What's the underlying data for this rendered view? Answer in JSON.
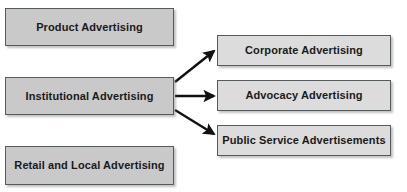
{
  "diagram": {
    "canvas": {
      "width": 407,
      "height": 192,
      "background": "#ffffff"
    },
    "colors": {
      "left_node_fill": "#c9c9c9",
      "right_node_fill": "#dcdcdc",
      "node_border": "#555a5c",
      "text": "#1a1a1a",
      "arrow": "#111111"
    },
    "left_nodes": [
      {
        "id": "product-advertising",
        "label": "Product Advertising",
        "x": 5,
        "y": 8,
        "width": 169,
        "height": 38
      },
      {
        "id": "institutional-advertising",
        "label": "Institutional Advertising",
        "x": 5,
        "y": 77,
        "width": 169,
        "height": 38
      },
      {
        "id": "retail-and-local-advertising",
        "label": "Retail and Local Advertising",
        "x": 5,
        "y": 146,
        "width": 169,
        "height": 39
      }
    ],
    "right_nodes": [
      {
        "id": "corporate-advertising",
        "label": "Corporate Advertising",
        "x": 217,
        "y": 35,
        "width": 174,
        "height": 31
      },
      {
        "id": "advocacy-advertising",
        "label": "Advocacy Advertising",
        "x": 217,
        "y": 80,
        "width": 174,
        "height": 31
      },
      {
        "id": "public-service-advertisements",
        "label": "Public Service Advertisements",
        "x": 217,
        "y": 125,
        "width": 174,
        "height": 31
      }
    ],
    "connectors": [
      {
        "id": "institutional-to-corporate",
        "from": "institutional-advertising",
        "to": "corporate-advertising",
        "x1": 175,
        "y1": 82,
        "x2": 214,
        "y2": 51
      },
      {
        "id": "institutional-to-advocacy",
        "from": "institutional-advertising",
        "to": "advocacy-advertising",
        "x1": 175,
        "y1": 96,
        "x2": 214,
        "y2": 96
      },
      {
        "id": "institutional-to-public-service",
        "from": "institutional-advertising",
        "to": "public-service-advertisements",
        "x1": 175,
        "y1": 110,
        "x2": 214,
        "y2": 134
      }
    ]
  }
}
